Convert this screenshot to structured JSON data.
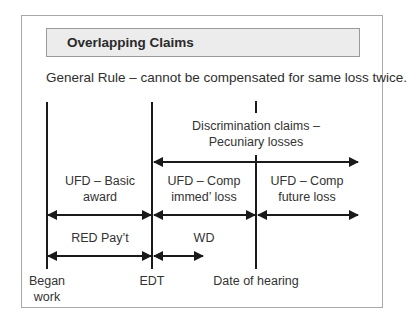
{
  "title": "Overlapping Claims",
  "general_rule": "General Rule – cannot be compensated for same loss twice.",
  "timeline": {
    "markers": [
      {
        "id": "began-work",
        "label_line1": "Began",
        "label_line2": "work"
      },
      {
        "id": "edt",
        "label_line1": "EDT"
      },
      {
        "id": "date-of-hearing",
        "label_line1": "Date of hearing"
      }
    ]
  },
  "spans": {
    "discrimination": {
      "line1": "Discrimination claims –",
      "line2": "Pecuniary losses"
    },
    "basic_award": {
      "line1": "UFD – Basic",
      "line2": "award"
    },
    "comp_immediate": {
      "line1": "UFD – Comp",
      "line2": "immed’ loss"
    },
    "comp_future": {
      "line1": "UFD – Comp",
      "line2": "future loss"
    },
    "red_pay": {
      "line1": "RED Pay’t"
    },
    "wd": {
      "line1": "WD"
    }
  },
  "colors": {
    "line": "#1a1a1a",
    "header_bg": "#ececec",
    "frame_border": "#a8a8a8"
  }
}
